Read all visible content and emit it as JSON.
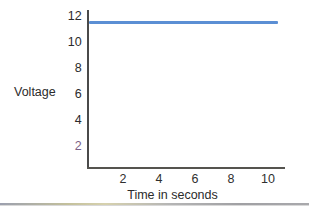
{
  "chart_data": {
    "type": "line",
    "title": "",
    "xlabel": "Time in seconds",
    "ylabel": "Voltage",
    "xlim": [
      0,
      11
    ],
    "ylim": [
      0,
      13
    ],
    "xticks": [
      2,
      4,
      6,
      8,
      10
    ],
    "yticks": [
      2,
      4,
      6,
      8,
      10,
      12
    ],
    "grid": false,
    "legend": null,
    "series": [
      {
        "name": "Voltage",
        "color": "#5b8fd4",
        "x": [
          0,
          1,
          2,
          3,
          4,
          5,
          6,
          7,
          8,
          9,
          10,
          10.6
        ],
        "values": [
          12,
          12,
          12,
          12,
          12,
          12,
          12,
          12,
          12,
          12,
          12,
          12
        ]
      }
    ]
  },
  "axes": {
    "y_title": "Voltage",
    "x_title": "Time in seconds",
    "y_tick_labels": [
      "12",
      "10",
      "8",
      "6",
      "4",
      "2"
    ],
    "x_tick_labels": [
      "2",
      "4",
      "6",
      "8",
      "10"
    ],
    "axis_color": "#4a4a4a"
  },
  "colors": {
    "line": "#5b8fd4",
    "text": "#2b2b2b",
    "axis": "#4a4a4a",
    "background": "#ffffff"
  }
}
